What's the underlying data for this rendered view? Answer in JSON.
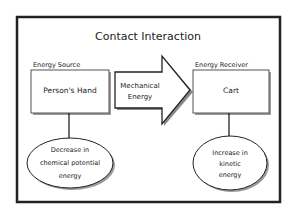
{
  "title": "Contact Interaction",
  "source": {
    "label": "Energy Source",
    "box_text": "Person's Hand",
    "effect_lines": [
      "Decrease in",
      "chemical potential",
      "energy"
    ]
  },
  "transfer": {
    "lines": [
      "Mechanical",
      "Energy"
    ]
  },
  "receiver": {
    "label": "Energy Receiver",
    "box_text": "Cart",
    "effect_lines": [
      "Increase in",
      "kinetic",
      "energy"
    ]
  },
  "colors": {
    "stroke": "#222222",
    "shadow": "#9a9a9a",
    "background": "#ffffff"
  }
}
